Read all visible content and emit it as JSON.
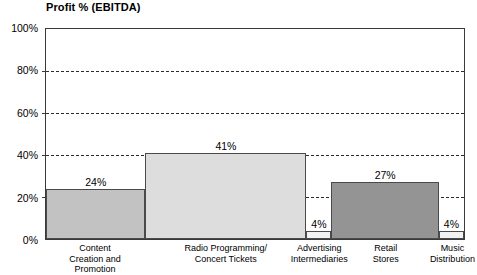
{
  "chart_data": {
    "type": "bar",
    "title": "Profit % (EBITDA)",
    "xlabel": "",
    "ylabel": "",
    "ylim": [
      0,
      100
    ],
    "grid": true,
    "legend": "none",
    "categories": [
      "Content\nCreation and\nPromotion",
      "Radio Programming/\nConcert Tickets",
      "Advertising\nIntermediaries",
      "Retail\nStores",
      "Music\nDistribution"
    ],
    "values": [
      24,
      41,
      4,
      27,
      4
    ],
    "value_labels": [
      "24%",
      "41%",
      "4%",
      "27%",
      "4%"
    ],
    "widths_pct": [
      23.8,
      38.5,
      6.0,
      25.7,
      6.0
    ],
    "bar_colors": [
      "#c2c2c2",
      "#dddddd",
      "#f2f2f2",
      "#949494",
      "#f2f2f2"
    ],
    "ytick_labels": [
      "0%",
      "20%",
      "40%",
      "60%",
      "80%",
      "100%"
    ],
    "ytick_values": [
      0,
      20,
      40,
      60,
      80,
      100
    ],
    "axis_color": "#3a3a3a",
    "gridline_color": "#2b2b2b"
  }
}
